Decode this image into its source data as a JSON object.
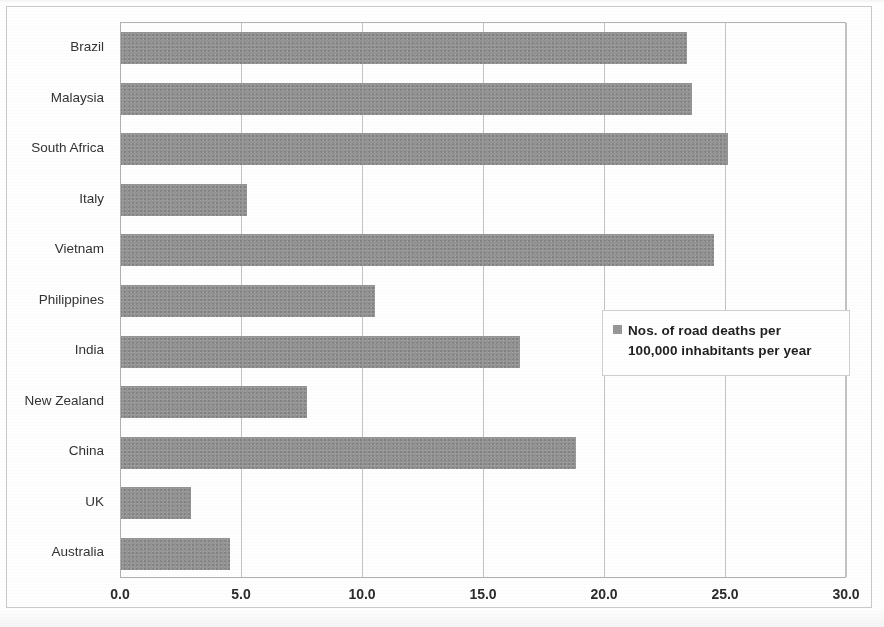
{
  "chart_data": {
    "type": "bar",
    "orientation": "horizontal",
    "title": "",
    "xlabel": "",
    "ylabel": "",
    "xlim": [
      0.0,
      30.0
    ],
    "xticks": [
      "0.0",
      "5.0",
      "10.0",
      "15.0",
      "20.0",
      "25.0",
      "30.0"
    ],
    "xtick_values": [
      0,
      5,
      10,
      15,
      20,
      25,
      30
    ],
    "grid": "vertical",
    "legend_position": "inside-right",
    "legend": [
      "Nos. of road deaths per 100,000 inhabitants per year"
    ],
    "series_color": "#949494",
    "categories": [
      "Brazil",
      "Malaysia",
      "South Africa",
      "Italy",
      "Vietnam",
      "Philippines",
      "India",
      "New Zealand",
      "China",
      "UK",
      "Australia"
    ],
    "values": [
      23.4,
      23.6,
      25.1,
      5.2,
      24.5,
      10.5,
      16.5,
      7.7,
      18.8,
      2.9,
      4.5
    ],
    "series": [
      {
        "name": "Nos. of road deaths per 100,000 inhabitants per year",
        "values": [
          23.4,
          23.6,
          25.1,
          5.2,
          24.5,
          10.5,
          16.5,
          7.7,
          18.8,
          2.9,
          4.5
        ]
      }
    ]
  },
  "legend": {
    "line1": "Nos. of road deaths per",
    "line2": "100,000 inhabitants per year"
  }
}
